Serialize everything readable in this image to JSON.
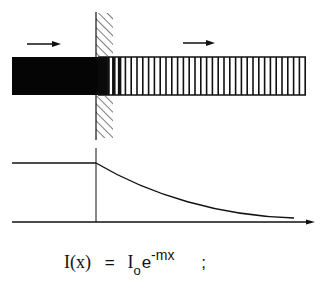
{
  "diagram": {
    "incident_arrow": "arrow-right",
    "transmitted_arrow": "arrow-right",
    "graph": {
      "type": "line",
      "curve": "constant then exponential decay",
      "x_axis": "arrow"
    },
    "formula": {
      "lhs": "I(x)",
      "equals": "=",
      "base": "I",
      "subscript": "o",
      "exp_base": "e",
      "exponent": "-mx",
      "terminator": ";"
    }
  },
  "chart_data": {
    "type": "line",
    "title": "",
    "xlabel": "x",
    "ylabel": "I",
    "series": [
      {
        "name": "I(x)",
        "x": [
          0,
          1,
          2,
          3,
          4,
          5,
          6
        ],
        "values": [
          1.0,
          1.0,
          0.55,
          0.3,
          0.17,
          0.1,
          0.06
        ]
      }
    ],
    "grid": false
  }
}
